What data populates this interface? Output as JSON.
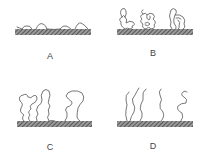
{
  "figure": {
    "panels": [
      {
        "id": "A",
        "label": "A",
        "description": "flat adsorbed chains (pancake)"
      },
      {
        "id": "B",
        "label": "B",
        "description": "compact coiled chains (mushroom)"
      },
      {
        "id": "C",
        "label": "C",
        "description": "extended loops"
      },
      {
        "id": "D",
        "label": "D",
        "description": "stretched brush chains"
      }
    ],
    "colors": {
      "substrate": "#555555",
      "chain": "#666666",
      "label": "#444444",
      "background": "#ffffff"
    }
  }
}
